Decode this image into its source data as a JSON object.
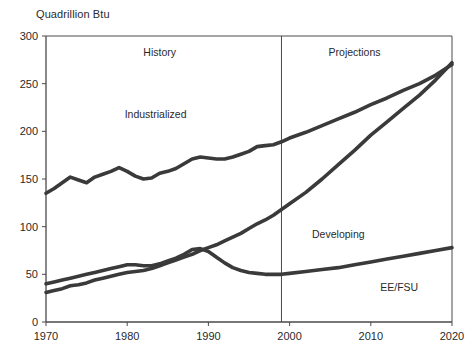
{
  "chart_data": {
    "type": "line",
    "title": "Quadrillion Btu",
    "xlabel": "",
    "ylabel": "Quadrillion Btu",
    "xlim": [
      1970,
      2020
    ],
    "ylim": [
      0,
      300
    ],
    "yticks": [
      0,
      50,
      100,
      150,
      200,
      250,
      300
    ],
    "xticks": [
      1970,
      1980,
      1990,
      2000,
      2010,
      2020
    ],
    "grid": false,
    "legend_position": "inline-annotations",
    "line_color": "#3a3a3a",
    "axis_color": "#4a4a4a",
    "divider_year": 1999,
    "annotations": [
      {
        "text": "History",
        "x": 1984,
        "y": 283
      },
      {
        "text": "Projections",
        "x": 2008,
        "y": 283
      },
      {
        "text": "Industrialized",
        "x": 1983.5,
        "y": 218
      },
      {
        "text": "Developing",
        "x": 2006,
        "y": 92
      },
      {
        "text": "EE/FSU",
        "x": 2013.5,
        "y": 37
      }
    ],
    "x": [
      1970,
      1971,
      1972,
      1973,
      1974,
      1975,
      1976,
      1977,
      1978,
      1979,
      1980,
      1981,
      1982,
      1983,
      1984,
      1985,
      1986,
      1987,
      1988,
      1989,
      1990,
      1991,
      1992,
      1993,
      1994,
      1995,
      1996,
      1997,
      1998,
      1999,
      2000,
      2002,
      2004,
      2006,
      2008,
      2010,
      2012,
      2014,
      2016,
      2018,
      2020
    ],
    "series": [
      {
        "name": "Industrialized",
        "values": [
          135,
          140,
          146,
          152,
          149,
          146,
          152,
          155,
          158,
          162,
          158,
          153,
          150,
          151,
          156,
          158,
          161,
          166,
          171,
          173,
          172,
          171,
          171,
          173,
          176,
          179,
          184,
          185,
          186,
          189,
          193,
          199,
          206,
          213,
          220,
          228,
          235,
          243,
          250,
          259,
          270
        ]
      },
      {
        "name": "Developing",
        "values": [
          31,
          33,
          35,
          38,
          39,
          41,
          44,
          46,
          48,
          50,
          52,
          53,
          54,
          56,
          59,
          62,
          65,
          68,
          71,
          75,
          78,
          81,
          85,
          89,
          93,
          98,
          103,
          107,
          112,
          118,
          124,
          136,
          150,
          165,
          180,
          196,
          210,
          224,
          238,
          254,
          272
        ]
      },
      {
        "name": "EE/FSU",
        "values": [
          40,
          42,
          44,
          46,
          48,
          50,
          52,
          54,
          56,
          58,
          60,
          60,
          59,
          59,
          61,
          64,
          67,
          71,
          76,
          77,
          74,
          68,
          62,
          57,
          54,
          52,
          51,
          50,
          50,
          50,
          51,
          53,
          55,
          57,
          60,
          63,
          66,
          69,
          72,
          75,
          78
        ]
      }
    ]
  }
}
